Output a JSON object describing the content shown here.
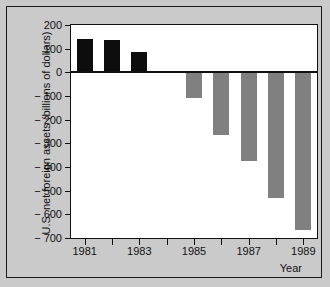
{
  "chart_data": {
    "type": "bar",
    "title": "",
    "subtitle": "",
    "xlabel": "Year",
    "ylabel": "U.S. net foreign assets  (billions of dollars)",
    "categories": [
      "1981",
      "1982",
      "1983",
      "1984",
      "1985",
      "1986",
      "1987",
      "1988",
      "1989"
    ],
    "values": [
      140,
      136,
      88,
      null,
      -108,
      -265,
      -375,
      -532,
      -665
    ],
    "ylim": [
      -700,
      200
    ],
    "ytick_values": [
      200,
      100,
      0,
      -100,
      -200,
      -300,
      -400,
      -500,
      -600,
      -700
    ],
    "ytick_labels": [
      "200",
      "100",
      "0",
      "− 100",
      "− 200",
      "− 300",
      "− 400",
      "− 500",
      "− 600",
      "− 700"
    ],
    "xtick_values": [
      "1981",
      "1982",
      "1983",
      "1984",
      "1985",
      "1986",
      "1987",
      "1988",
      "1989"
    ],
    "xtick_labels": [
      "1981",
      "",
      "1983",
      "",
      "1985",
      "",
      "1987",
      "",
      "1989"
    ],
    "grid": false,
    "legend": false,
    "series": [
      {
        "name": "U.S. net foreign assets",
        "values": [
          140,
          136,
          88,
          null,
          -108,
          -265,
          -375,
          -532,
          -665
        ]
      }
    ],
    "colors": {
      "positive_bar": "#0d0d0d",
      "negative_bar": "#808080",
      "plot_background": "#ffffff",
      "figure_background": "#cacaca",
      "axis": "#111111"
    }
  }
}
